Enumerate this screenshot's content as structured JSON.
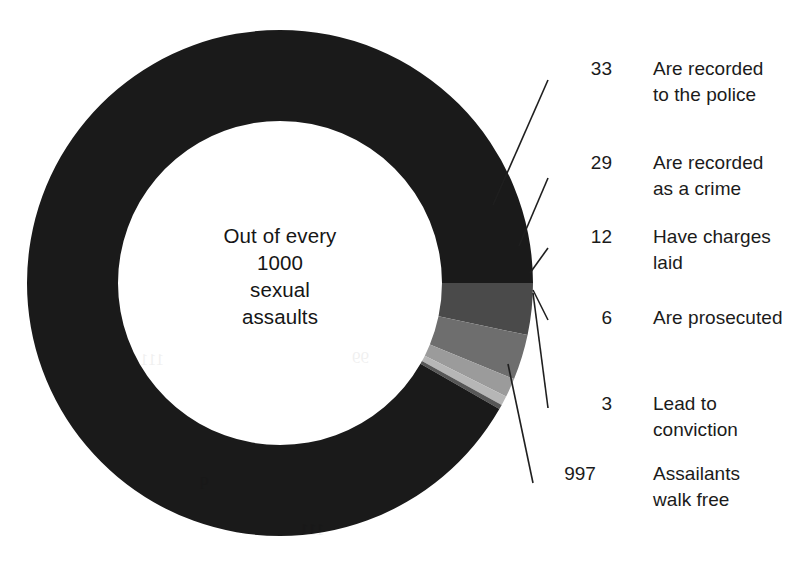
{
  "figure": {
    "center_text": {
      "lines": [
        "Out of every",
        "1000",
        "sexual",
        "assaults"
      ]
    },
    "ghost_artifacts": [
      {
        "text": "111",
        "left": 140,
        "top": 350
      },
      {
        "text": "99",
        "left": 352,
        "top": 348
      },
      {
        "text": "q",
        "left": 200,
        "top": 470
      },
      {
        "text": "111",
        "left": 300,
        "top": 520
      }
    ]
  },
  "callouts": [
    {
      "value": "33",
      "label": "Are recorded\nto the police",
      "value_left": 556,
      "value_top": 56,
      "label_left": 653,
      "label_top": 56
    },
    {
      "value": "29",
      "label": "Are recorded\nas a crime",
      "value_left": 556,
      "value_top": 150,
      "label_left": 653,
      "label_top": 150
    },
    {
      "value": "12",
      "label": "Have charges\nlaid",
      "value_left": 556,
      "value_top": 224,
      "label_left": 653,
      "label_top": 224
    },
    {
      "value": "6",
      "label": "Are prosecuted",
      "value_left": 556,
      "value_top": 305,
      "label_left": 653,
      "label_top": 305
    },
    {
      "value": "3",
      "label": "Lead to\nconviction",
      "value_left": 556,
      "value_top": 391,
      "label_left": 653,
      "label_top": 391
    },
    {
      "value": "997",
      "label": "Assailants\nwalk free",
      "value_left": 540,
      "value_top": 461,
      "label_left": 653,
      "label_top": 461
    }
  ],
  "chart_data": {
    "type": "pie",
    "title": "Out of every 1000 sexual assaults",
    "subtitle": "",
    "donut": true,
    "total": 1000,
    "units": "sexual assaults per 1000",
    "center_label": "Out of every 1000 sexual assaults",
    "legend_position": "right",
    "grid": false,
    "categories": [
      "Are recorded to the police",
      "Are recorded as a crime",
      "Have charges laid",
      "Are prosecuted",
      "Lead to conviction",
      "Assailants walk free"
    ],
    "values": [
      33,
      29,
      12,
      6,
      3,
      997
    ],
    "colors": [
      "#4a4a4a",
      "#6e6e6e",
      "#9b9b9b",
      "#b6b6b6",
      "#575757",
      "#1a1a1a"
    ],
    "annotations": [
      "33 Are recorded to the police",
      "29 Are recorded as a crime",
      "12 Have charges laid",
      "6 Are prosecuted",
      "3 Lead to conviction",
      "997 Assailants walk free"
    ],
    "note": "Nested funnel: each sub-stage is a subset of the previous; 997 of 1000 assailants walk free.",
    "geometry": {
      "center_x": 280,
      "center_y": 283,
      "outer_radius": 253,
      "inner_radius": 162,
      "start_angle_deg": -90,
      "direction": "clockwise",
      "ring_scale_total": 1000,
      "segment_order_from_top": [
        "Assailants walk free",
        "Are recorded to the police",
        "Are recorded as a crime",
        "Have charges laid",
        "Are prosecuted",
        "Lead to conviction"
      ]
    },
    "leader_lines": [
      {
        "series": "Are recorded to the police",
        "x1": 493,
        "y1": 205,
        "x2": 548,
        "y2": 80
      },
      {
        "series": "Are recorded as a crime",
        "x1": 519,
        "y1": 246,
        "x2": 548,
        "y2": 178
      },
      {
        "series": "Have charges laid",
        "x1": 530,
        "y1": 273,
        "x2": 548,
        "y2": 248
      },
      {
        "series": "Are prosecuted",
        "x1": 533,
        "y1": 290,
        "x2": 548,
        "y2": 320
      },
      {
        "series": "Lead to conviction",
        "x1": 533,
        "y1": 293,
        "x2": 548,
        "y2": 408
      },
      {
        "series": "Assailants walk free",
        "x1": 508,
        "y1": 364,
        "x2": 533,
        "y2": 483
      }
    ]
  }
}
